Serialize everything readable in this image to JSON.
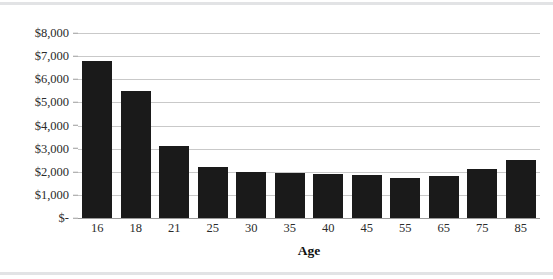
{
  "chart_data": {
    "type": "bar",
    "title": "",
    "subtitle": "",
    "xlabel": "Age",
    "ylabel": "",
    "categories": [
      "16",
      "18",
      "21",
      "25",
      "30",
      "35",
      "40",
      "45",
      "55",
      "65",
      "75",
      "85"
    ],
    "values": [
      6800,
      5500,
      3100,
      2200,
      1980,
      1950,
      1900,
      1870,
      1750,
      1800,
      2100,
      2500
    ],
    "series": [
      {
        "name": "",
        "values": [
          6800,
          5500,
          3100,
          2200,
          1980,
          1950,
          1900,
          1870,
          1750,
          1800,
          2100,
          2500
        ]
      }
    ],
    "ylim": [
      0,
      8000
    ],
    "ytick_values": [
      8000,
      7000,
      6000,
      5000,
      4000,
      3000,
      2000,
      1000,
      0
    ],
    "ytick_labels": [
      "$8,000",
      "$7,000",
      "$6,000",
      "$5,000",
      "$4,000",
      "$3,000",
      "$2,000",
      "$1,000",
      "$-"
    ],
    "grid": true,
    "legend": false,
    "legend_position": "none",
    "bar_color": "#1a1a1a",
    "gridline_color": "#c9c9c9",
    "axis_color": "#9a9a9a",
    "text_color": "#2b2b2b"
  }
}
